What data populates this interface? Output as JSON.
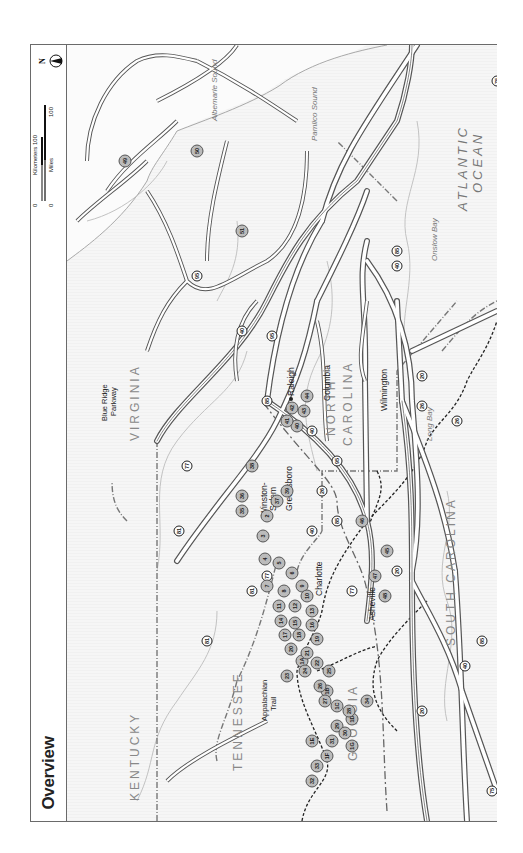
{
  "page": {
    "title": "Overview"
  },
  "scale_bar": {
    "kilometers_label": "Kilometers",
    "miles_label": "Miles",
    "km_zero": "0",
    "km_max": "100",
    "mi_zero": "0",
    "mi_max": "100",
    "north_label": "N"
  },
  "map": {
    "states": [
      {
        "name": "KENTUCKY"
      },
      {
        "name": "TENNESSEE"
      },
      {
        "name": "VIRGINIA"
      },
      {
        "name": "NORTH"
      },
      {
        "name": "CAROLINA"
      },
      {
        "name": "SOUTH CAROLINA"
      },
      {
        "name": "GEORGIA"
      }
    ],
    "water": {
      "ocean_line1": "ATLANTIC",
      "ocean_line2": "OCEAN",
      "albemarle": "Albemarle Sound",
      "pamlico": "Pamlico Sound",
      "onslow": "Onslow Bay",
      "long_bay": "Long Bay"
    },
    "cities": [
      {
        "name": "Raleigh"
      },
      {
        "name": "Greensboro"
      },
      {
        "name": "Winston-"
      },
      {
        "name": "Salem"
      },
      {
        "name": "Charlotte"
      },
      {
        "name": "Asheville"
      },
      {
        "name": "Columbia"
      },
      {
        "name": "Wilmington"
      }
    ],
    "features": {
      "blue_ridge_1": "Blue Ridge",
      "blue_ridge_2": "Parkway",
      "at_1": "Appalachian",
      "at_2": "Trail"
    },
    "interstates": [
      "75",
      "75",
      "81",
      "81",
      "81",
      "77",
      "77",
      "77",
      "40",
      "40",
      "40",
      "40",
      "40",
      "85",
      "85",
      "85",
      "85",
      "95",
      "95",
      "95",
      "26",
      "26",
      "26",
      "20",
      "20",
      "20"
    ],
    "us_routes": [
      "17",
      "17",
      "64",
      "264",
      "421",
      "421",
      "70",
      "74",
      "158",
      "12",
      "12",
      "64",
      "17"
    ],
    "sites": [
      "1A",
      "1B",
      "1C",
      "1D",
      "1E",
      "1F",
      "1G",
      "2",
      "3",
      "4",
      "5",
      "6",
      "7",
      "8",
      "9",
      "10",
      "11",
      "12",
      "13",
      "14",
      "15",
      "16",
      "17",
      "18",
      "19",
      "20",
      "21",
      "22",
      "23",
      "24",
      "25",
      "26",
      "27",
      "28",
      "29",
      "30",
      "31",
      "32",
      "33",
      "34",
      "35",
      "36",
      "37",
      "38",
      "39",
      "40",
      "41",
      "42",
      "43",
      "44",
      "45",
      "46",
      "47",
      "48",
      "49",
      "50",
      "51"
    ]
  }
}
